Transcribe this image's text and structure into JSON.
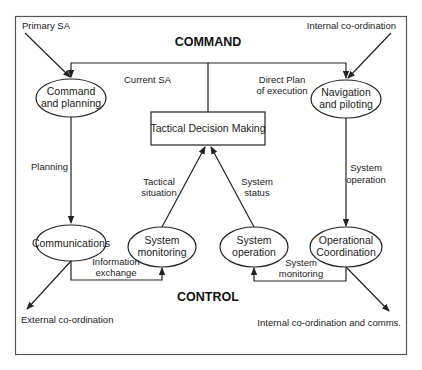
{
  "diagram": {
    "sections": {
      "command": "COMMAND",
      "control": "CONTROL"
    },
    "nodes": {
      "command_planning": [
        "Command",
        "and planning"
      ],
      "navigation_piloting": [
        "Navigation",
        "and piloting"
      ],
      "tactical_decision": "Tactical Decision Making",
      "communications": "Communications",
      "system_monitoring": [
        "System",
        "monitoring"
      ],
      "system_operation": [
        "System",
        "operation"
      ],
      "operational_coordination": [
        "Operational",
        "Coordination"
      ]
    },
    "edge_labels": {
      "primary_sa": "Primary SA",
      "internal_coordination": "Internal co-ordination",
      "current_sa": "Current SA",
      "direct_plan": [
        "Direct Plan",
        "of execution"
      ],
      "planning": "Planning",
      "system_operation_edge": [
        "System",
        "operation"
      ],
      "tactical_situation": [
        "Tactical",
        "situation"
      ],
      "system_status": [
        "System",
        "status"
      ],
      "information_exchange": [
        "Information",
        "exchange"
      ],
      "system_monitoring_edge": [
        "System",
        "monitoring"
      ],
      "external_coordination": "External co-ordination",
      "internal_coordination_comms": "Internal co-ordination and comms."
    }
  }
}
